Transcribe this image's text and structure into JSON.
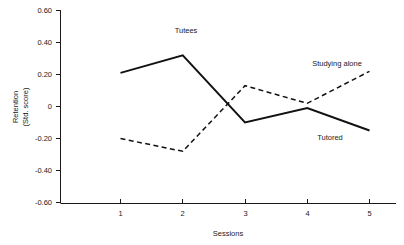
{
  "chart_data": {
    "type": "line",
    "title": "",
    "xlabel": "Sessions",
    "ylabel": "Retention (Std. score)",
    "ylabel_line1": "Retention",
    "ylabel_line2": "(Std. score)",
    "categories": [
      "1",
      "2",
      "3",
      "4",
      "5"
    ],
    "x": [
      1,
      2,
      3,
      4,
      5
    ],
    "xlim": [
      0.6,
      5.6
    ],
    "ylim": [
      -0.6,
      0.6
    ],
    "ytick_labels": [
      "0.60",
      "0.40",
      "0.20",
      "0",
      "-0.20",
      "-0.40",
      "-0.60"
    ],
    "ytick_values": [
      0.6,
      0.4,
      0.2,
      0,
      -0.2,
      -0.4,
      -0.6
    ],
    "xtick_labels": [
      "1",
      "2",
      "3",
      "4",
      "5"
    ],
    "grid": false,
    "legend_position": "inline-annotations",
    "series": [
      {
        "name": "Tutees",
        "style": "solid",
        "values": [
          0.21,
          0.32,
          -0.1,
          -0.01,
          -0.15
        ],
        "label_text": "Tutees"
      },
      {
        "name": "Studying alone",
        "style": "dashed",
        "values": [
          -0.2,
          -0.28,
          0.13,
          0.02,
          0.22
        ],
        "label_text": "Studying alone"
      }
    ],
    "annotations": [
      {
        "text": "Tutees",
        "series": "Tutees",
        "x": 1.95,
        "y": 0.52
      },
      {
        "text": "Tutored",
        "series": "Tutees",
        "x": 4.35,
        "y": -0.13
      },
      {
        "text": "Studying alone",
        "series": "Studying alone",
        "x": 5.1,
        "y": 0.31
      }
    ]
  },
  "axes": {
    "y_title_line1": "Retention",
    "y_title_line2": "(Std. score)",
    "x_title": "Sessions",
    "y_ticks": [
      {
        "label": "0.60"
      },
      {
        "label": "0.40"
      },
      {
        "label": "0.20"
      },
      {
        "label": "0"
      },
      {
        "label": "-0.20"
      },
      {
        "label": "-0.40"
      },
      {
        "label": "-0.60"
      }
    ],
    "x_ticks": [
      {
        "label": "1"
      },
      {
        "label": "2"
      },
      {
        "label": "3"
      },
      {
        "label": "4"
      },
      {
        "label": "5"
      }
    ]
  },
  "labels": {
    "tutees": "Tutees",
    "tutored": "Tutored",
    "studying_alone": "Studying alone"
  },
  "colors": {
    "ink": "#111111",
    "background": "#ffffff"
  }
}
